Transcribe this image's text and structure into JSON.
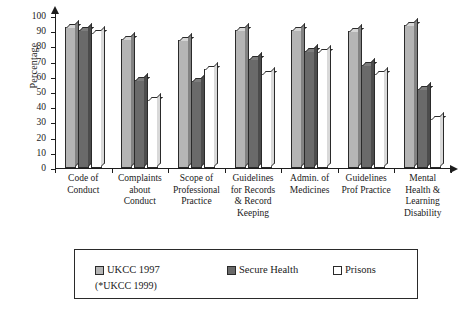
{
  "chart_data": {
    "type": "bar",
    "title": "",
    "subtitle": "",
    "xlabel": "",
    "ylabel": "Percentage",
    "ylim": [
      0,
      100
    ],
    "yticks": [
      0,
      10,
      20,
      30,
      40,
      50,
      60,
      70,
      80,
      90,
      100
    ],
    "ytick_labels": [
      "0",
      "10",
      "20",
      "30",
      "40",
      "50",
      "60",
      "70",
      "80",
      "90",
      "100"
    ],
    "grid": false,
    "legend_position": "bottom",
    "categories": [
      "Code of Conduct",
      "Complaints about Conduct",
      "Scope of Professional Practice",
      "Guidelines for Records & Record Keeping",
      "Admin. of Medicines",
      "Guidelines Prof Practice",
      "Mental Health & Learning Disability"
    ],
    "category_lines": [
      [
        "Code of",
        "Conduct"
      ],
      [
        "Complaints",
        "about",
        "Conduct"
      ],
      [
        "Scope of",
        "Professional",
        "Practice"
      ],
      [
        "Guidelines",
        "for Records",
        "& Record",
        "Keeping"
      ],
      [
        "Admin. of",
        "Medicines"
      ],
      [
        "Guidelines",
        "Prof Practice"
      ],
      [
        "Mental",
        "Health &",
        "Learning",
        "Disability"
      ]
    ],
    "series": [
      {
        "name": "UKCC 1997",
        "note": "(*UKCC 1999)",
        "color": "#b5b5b5",
        "values": [
          93,
          85,
          84,
          91,
          91,
          90,
          94
        ]
      },
      {
        "name": "Secure Health",
        "color": "#6a6a6a",
        "values": [
          91,
          58,
          57,
          72,
          77,
          68,
          52
        ]
      },
      {
        "name": "Prisons",
        "color": "#ffffff",
        "values": [
          89,
          45,
          65,
          62,
          76,
          62,
          32
        ]
      }
    ]
  },
  "legend": {
    "items": [
      {
        "label": "UKCC 1997",
        "color": "#b5b5b5"
      },
      {
        "label": "Secure Health",
        "color": "#6a6a6a"
      },
      {
        "label": "Prisons",
        "color": "#ffffff"
      }
    ],
    "footnote": "(*UKCC 1999)"
  },
  "axis": {
    "y_title": "Percentage"
  }
}
